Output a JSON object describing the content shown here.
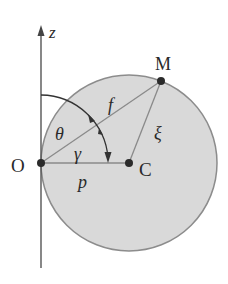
{
  "diagram": {
    "type": "geometry",
    "axis_label": "z",
    "points": {
      "origin": "O",
      "center": "C",
      "point_on_circle": "M"
    },
    "segments": {
      "OM": "f",
      "CM": "ξ",
      "OC": "p"
    },
    "angles": {
      "z_to_OM": "θ",
      "OM_to_OC": "γ"
    },
    "colors": {
      "disc_fill": "#d9d9d9",
      "disc_stroke": "#8c8c8c",
      "line": "#555555",
      "point": "#2b2b2b",
      "text": "#2a2a2a"
    }
  }
}
